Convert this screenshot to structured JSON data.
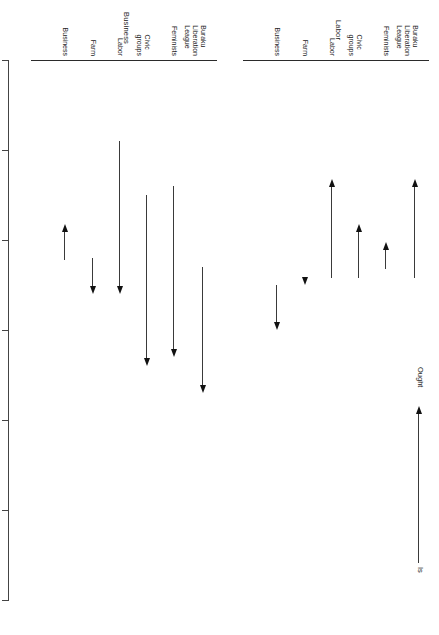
{
  "figure": {
    "axis_title": "Scale of Influence",
    "axis_ticks": [
      "7",
      "6",
      "5",
      "4",
      "3",
      "2",
      "1"
    ],
    "axis_min": 1,
    "axis_max": 7,
    "categories": [
      "Business",
      "Farm",
      "Labor",
      "Civic\ngroups",
      "Feminists",
      "Buraku\nLiberation\nLeague"
    ],
    "panels": [
      {
        "title": "Labor"
      },
      {
        "title": "Business"
      }
    ],
    "legend": {
      "from_label": "Is",
      "to_label": "Ought"
    },
    "ink_color": "#1a1a1a"
  },
  "chart_data": {
    "type": "line",
    "title": "Scale of Influence",
    "xlabel": "Scale of Influence",
    "ylabel": "",
    "xlim": [
      7,
      1
    ],
    "grid": false,
    "legend_position": "top-right",
    "annotations": [
      "Is",
      "Ought"
    ],
    "note": "Each marker is an arrow running from the respondent group's perceived 'Is' influence rating to its preferred 'Ought' rating, on a 1-7 scale (7 = most influence). Two respondent panels: Labor and Business.",
    "categories": [
      "Business",
      "Farm",
      "Labor",
      "Civic groups",
      "Feminists",
      "Buraku Liberation League"
    ],
    "panels": [
      {
        "name": "Labor",
        "series": [
          {
            "name": "Is",
            "values": [
              4.5,
              4.6,
              4.5,
              4.5,
              4.6,
              4.5
            ]
          },
          {
            "name": "Ought",
            "values": [
              4.0,
              4.5,
              5.6,
              5.1,
              4.9,
              5.6
            ]
          }
        ]
      },
      {
        "name": "Business",
        "series": [
          {
            "name": "Is",
            "values": [
              4.7,
              4.8,
              6.1,
              5.5,
              5.6,
              4.7
            ]
          },
          {
            "name": "Ought",
            "values": [
              5.1,
              4.4,
              4.4,
              3.6,
              3.7,
              3.3
            ]
          }
        ]
      }
    ]
  },
  "arrows": {
    "labor": [
      {
        "category": "Business",
        "is": 4.5,
        "ought": 4.0
      },
      {
        "category": "Farm",
        "is": 4.6,
        "ought": 4.5
      },
      {
        "category": "Labor",
        "is": 4.5,
        "ought": 5.6
      },
      {
        "category": "Civic groups",
        "is": 4.5,
        "ought": 5.1
      },
      {
        "category": "Feminists",
        "is": 4.6,
        "ought": 4.9
      },
      {
        "category": "Buraku Liberation League",
        "is": 4.5,
        "ought": 5.6
      }
    ],
    "business": [
      {
        "category": "Business",
        "is": 4.7,
        "ought": 5.1
      },
      {
        "category": "Farm",
        "is": 4.8,
        "ought": 4.4
      },
      {
        "category": "Labor",
        "is": 6.1,
        "ought": 4.4
      },
      {
        "category": "Civic groups",
        "is": 5.5,
        "ought": 3.6
      },
      {
        "category": "Feminists",
        "is": 5.6,
        "ought": 3.7
      },
      {
        "category": "Buraku Liberation League",
        "is": 4.7,
        "ought": 3.3
      }
    ]
  }
}
